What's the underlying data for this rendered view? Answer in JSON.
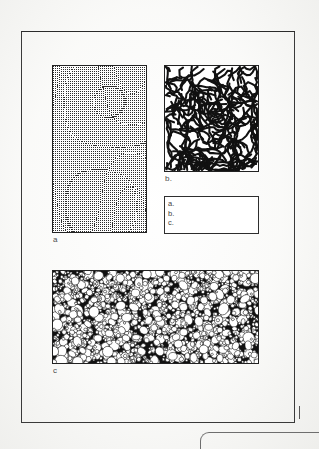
{
  "document": {
    "type": "scanned-figure-page",
    "background_color": "#fcfcfb",
    "ink_color": "#222222",
    "frame": {
      "name": "page-frame",
      "border_color": "#3a3a3a"
    }
  },
  "figure": {
    "panels": [
      {
        "id": "a",
        "label": "a",
        "pattern": "dot-lattice",
        "description": "fine square dot lattice with gentle curvature",
        "fill": "#ffffff",
        "dot_color": "#2b2b2b"
      },
      {
        "id": "b",
        "label": "b.",
        "pattern": "labyrinth",
        "description": "labyrinthine spinodal stripe pattern",
        "fill": "#ffffff",
        "stroke_color": "#111111"
      },
      {
        "id": "c",
        "label": "c",
        "pattern": "cellular-foam",
        "description": "dense polygonal cellular foam, white cells on dark walls",
        "fill": "#ffffff",
        "wall_color": "#141414"
      }
    ],
    "caption_box": {
      "name": "caption-box",
      "lines": [
        "a.",
        "b.",
        "c."
      ]
    }
  },
  "marks": {
    "tick": "|",
    "page_edge": "rounded-page-corner"
  }
}
